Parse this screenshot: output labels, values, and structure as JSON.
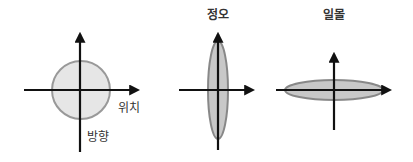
{
  "diagrams": [
    {
      "title": "",
      "shape": "circle",
      "x_axis_label": "위치",
      "y_axis_label": "방향",
      "fill": "#e6e6e6",
      "stroke": "#999999"
    },
    {
      "title": "정오",
      "shape": "vertical-ellipse",
      "fill": "#c8c8c8",
      "stroke": "#888888"
    },
    {
      "title": "일몰",
      "shape": "horizontal-ellipse",
      "fill": "#c8c8c8",
      "stroke": "#888888"
    }
  ],
  "colors": {
    "axis": "#111111",
    "text": "#333333"
  }
}
